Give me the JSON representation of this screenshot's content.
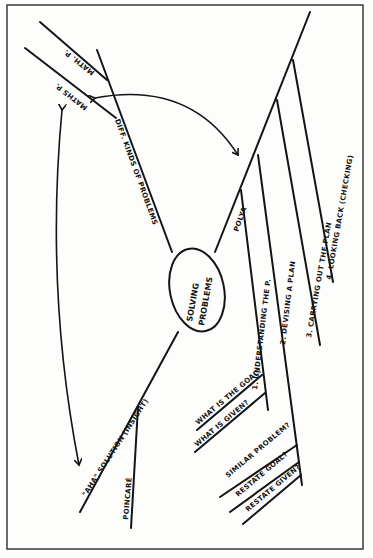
{
  "diagram": {
    "type": "mind-map",
    "orientation": "rotated-90",
    "colors": {
      "ink": "#141414",
      "paper": "#fdfdfc",
      "frame": "#3a3a3a"
    },
    "center": {
      "line1": "SOLVING",
      "line2": "PROBLEMS"
    },
    "branches": {
      "kinds": {
        "label": "DIFF. KINDS OF PROBLEMS",
        "children": [
          "MATH. P.",
          "MATHS P."
        ]
      },
      "polya": {
        "label": "POLYA",
        "steps": [
          "1. UNDERSTANDING THE P.",
          "2. DEVISING A PLAN",
          "3. CARRYING OUT THE PLAN",
          "4. LOOKING BACK (CHECKING)"
        ],
        "step1_children": [
          "WHAT IS THE GOAL?",
          "WHAT IS GIVEN?"
        ],
        "step2_children": [
          "SIMILAR PROBLEM?",
          "RESTATE GOAL?",
          "RESTATE GIVEN?"
        ]
      },
      "insight": {
        "label": "\"AHA\" SOLUTION (INSIGHT)",
        "children": [
          "POINCARÉ"
        ]
      }
    },
    "connections": [
      {
        "from": "MATHS P.",
        "to": "\"AHA\" SOLUTION (INSIGHT)",
        "style": "double-arrow"
      },
      {
        "from": "MATHS P.",
        "to": "POLYA",
        "style": "double-arrow"
      }
    ]
  }
}
